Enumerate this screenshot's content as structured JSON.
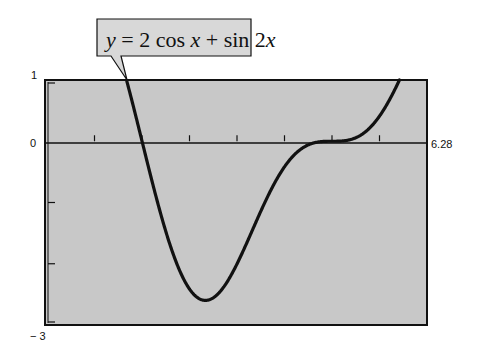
{
  "chart_data": {
    "type": "line",
    "title": "y = 2 cos x + sin 2x",
    "function": "2*cos(x)+sin(2*x)",
    "xlabel": "",
    "ylabel": "",
    "xlim": [
      0,
      6.28
    ],
    "ylim": [
      -3,
      1
    ],
    "grid": false,
    "legend": "callout box above plot, top-left, pointing to curve",
    "x_tick_step": 0.785,
    "y_ticks": [
      1,
      0,
      -1,
      -2,
      -3
    ],
    "axis_labels": {
      "y_top": "1",
      "y_zero": "0",
      "y_bottom": "− 3",
      "x_right": "6.28"
    },
    "series": [
      {
        "name": "y = 2 cos x + sin 2x",
        "x": [
          0,
          0.5,
          1.0,
          1.5,
          2.0,
          2.5,
          3.0,
          3.5,
          4.0,
          4.5,
          5.0,
          5.5,
          6.0,
          6.28
        ],
        "values": [
          2.0,
          2.6,
          1.99,
          0.28,
          -1.59,
          -2.56,
          -2.26,
          -1.21,
          -0.32,
          0.0,
          0.02,
          0.5,
          1.38,
          2.0
        ]
      }
    ],
    "key_points": {
      "visible_start": {
        "x": 1.33,
        "y": 1
      },
      "minimum": {
        "x": 2.62,
        "y": -2.6
      },
      "flat_region": {
        "x": 4.71,
        "y": 0
      },
      "visible_end": {
        "x": 5.86,
        "y": 1
      }
    },
    "colors": {
      "plot_fill": "#c8c8c8",
      "curve": "#111111",
      "frame": "#111111",
      "callout_fill": "#d8d8d8"
    }
  }
}
